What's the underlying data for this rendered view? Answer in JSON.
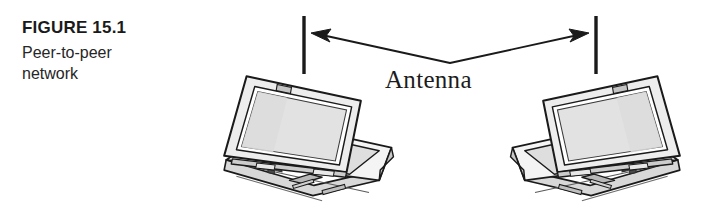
{
  "figure": {
    "number_label": "FIGURE 15.1",
    "caption_lines": [
      "Peer-to-peer",
      "network"
    ],
    "diagram_label": "Antenna"
  },
  "colors": {
    "background": "#ffffff",
    "ink": "#1a1a1a",
    "caption_text": "#262626",
    "screen_fill": "#e4e4e4",
    "screen_fill_dark": "#d2d2d2",
    "body_fill": "#f2f2f2",
    "body_shade": "#c9c9c9",
    "key_fill": "#555555",
    "trackpad_fill": "#bdbdbd"
  },
  "diagram": {
    "type": "peer-to-peer-wireless-network",
    "nodes": [
      {
        "id": "laptop-left",
        "label": "laptop",
        "antenna": true
      },
      {
        "id": "laptop-right",
        "label": "laptop",
        "antenna": true
      }
    ],
    "link": {
      "id": "wireless-link",
      "label": "Antenna",
      "style": "double-headed-arrow",
      "shape": "v-bend"
    }
  }
}
